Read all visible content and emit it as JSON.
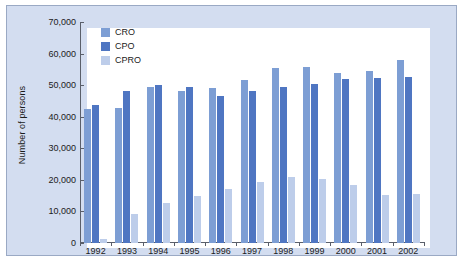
{
  "chart_data": {
    "type": "bar",
    "title": "",
    "subtitle": "",
    "xlabel": "",
    "ylabel": "Number of persons",
    "categories": [
      "1992",
      "1993",
      "1994",
      "1995",
      "1996",
      "1997",
      "1998",
      "1999",
      "2000",
      "2001",
      "2002"
    ],
    "series": [
      {
        "name": "CRO",
        "color": "#7d9ed4",
        "values": [
          42300,
          42800,
          49500,
          48200,
          49200,
          51500,
          55300,
          55600,
          54000,
          54400,
          58100
        ]
      },
      {
        "name": "CPO",
        "color": "#4f76c2",
        "values": [
          43800,
          48300,
          50200,
          49400,
          46500,
          48000,
          49500,
          50400,
          52000,
          52200,
          52500
        ]
      },
      {
        "name": "CPRO",
        "color": "#bdcdea",
        "values": [
          1300,
          9200,
          12700,
          14900,
          17000,
          19200,
          21000,
          20400,
          18500,
          15300,
          15500
        ]
      }
    ],
    "ylim": [
      0,
      70000
    ],
    "ytick_values": [
      0,
      10000,
      20000,
      30000,
      40000,
      50000,
      60000,
      70000
    ],
    "ytick_labels": [
      "0",
      "10,000",
      "20,000",
      "30,000",
      "40,000",
      "50,000",
      "60,000",
      "70,000"
    ],
    "grid": false,
    "legend_position": "top-left",
    "legend_entries": [
      "CRO",
      "CPO",
      "CPRO"
    ],
    "panel_background": "#d3ddf0",
    "plot_background": "#ffffff",
    "axis_color": "#5a5f6a"
  }
}
